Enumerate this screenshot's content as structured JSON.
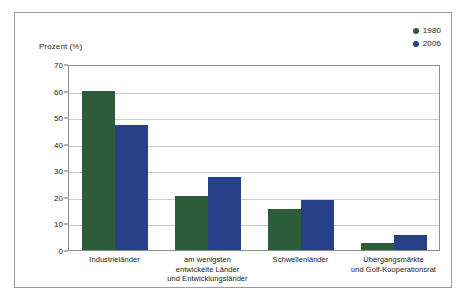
{
  "chart_data": {
    "type": "bar",
    "title": "",
    "xlabel": "",
    "ylabel": "Prozent (%)",
    "ylim": [
      0,
      70
    ],
    "yticks": [
      0,
      10,
      20,
      30,
      40,
      50,
      60,
      70
    ],
    "grid": true,
    "legend_position": "top-right",
    "categories": [
      "Industrieländer",
      "am wenigsten\nentwickelte Länder\nund Entwicklungsländer",
      "Schwellenländer",
      "Übergangsmärkte\nund Golf-Kooperationsrat"
    ],
    "category_lines": [
      [
        "Industrieländer"
      ],
      [
        "am wenigsten",
        "entwickelte Länder",
        "und Entwicklungsländer"
      ],
      [
        "Schwellenländer"
      ],
      [
        "Übergangsmärkte",
        "und Golf-Kooperationsrat"
      ]
    ],
    "series": [
      {
        "name": "1980",
        "color": "#2c5c39",
        "values": [
          60,
          20.5,
          15.5,
          2.5
        ]
      },
      {
        "name": "2006",
        "color": "#26408a",
        "values": [
          47,
          27.5,
          19,
          5.5
        ]
      }
    ]
  },
  "legend": {
    "items": [
      {
        "label": "1980",
        "color": "#2c5c39"
      },
      {
        "label": "2006",
        "color": "#26408a"
      }
    ]
  },
  "axis": {
    "y_title": "Prozent (%)",
    "y_tick_labels": [
      "70",
      "60",
      "50",
      "40",
      "30",
      "20",
      "10",
      "0"
    ]
  },
  "colors": {
    "series_1980": "#2c5c39",
    "series_2006": "#26408a",
    "frame": "#9a9a9a",
    "plot_border": "#8d8d8d",
    "gridline": "#c9c9c9",
    "text": "#1b1b1b",
    "background": "#ffffff"
  }
}
